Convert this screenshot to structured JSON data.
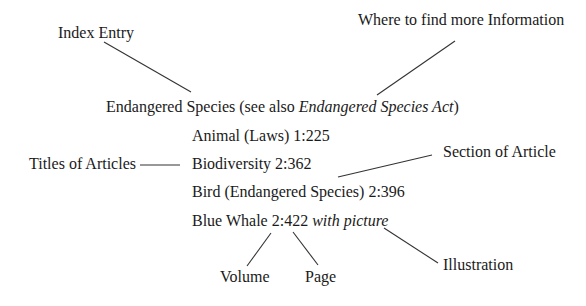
{
  "diagram": {
    "labels": {
      "index_entry": "Index Entry",
      "more_info": "Where to find more Information",
      "titles_of_articles": "Titles of Articles",
      "section_of_article": "Section of Article",
      "volume": "Volume",
      "page": "Page",
      "illustration": "Illustration"
    },
    "index": {
      "heading": "Endangered Species (see also ",
      "heading_italic": "Endangered Species Act",
      "heading_close": ")",
      "entries": [
        {
          "text": "Animal (Laws) 1:225"
        },
        {
          "text": "Biodiversity 2:362"
        },
        {
          "text": "Bird (Endangered Species) 2:396"
        },
        {
          "text": "Blue Whale 2:422 ",
          "italic": "with picture"
        }
      ]
    },
    "colors": {
      "text": "#1a1a1a",
      "line": "#333333",
      "background": "#ffffff"
    }
  }
}
